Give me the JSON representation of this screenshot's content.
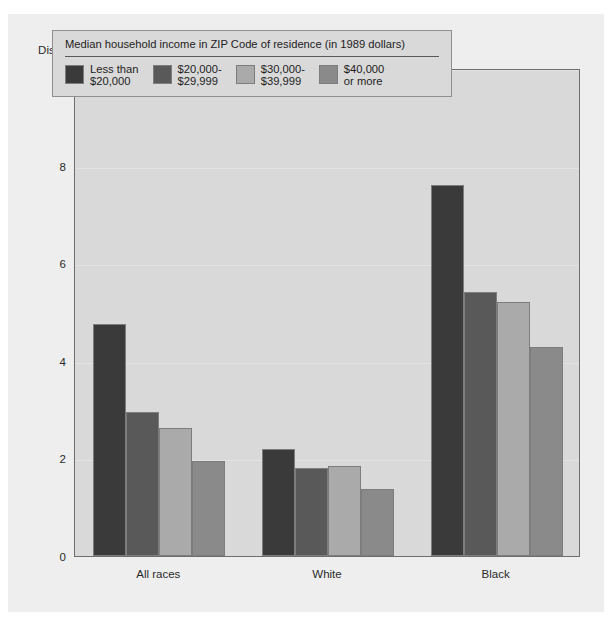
{
  "chart_data": {
    "type": "bar",
    "title": "",
    "ylabel": "Discharges per 1,000 population",
    "xlabel": "",
    "ylim": [
      0,
      10
    ],
    "yticks": [
      0,
      2,
      4,
      6,
      8,
      10
    ],
    "ytick_labels": [
      "0",
      "2",
      "4",
      "6",
      "8",
      "10"
    ],
    "grid": true,
    "legend_position": "inside-top-left",
    "legend_title": "Median household income in ZIP Code of residence (in 1989 dollars)",
    "categories": [
      "All races",
      "White",
      "Black"
    ],
    "series": [
      {
        "name": "Less than $20,000",
        "label_line1": "Less than",
        "label_line2": "$20,000",
        "color": "#3a3a3a",
        "values": [
          4.75,
          2.2,
          7.6
        ]
      },
      {
        "name": "$20,000-$29,999",
        "label_line1": "$20,000-",
        "label_line2": "$29,999",
        "color": "#595959",
        "values": [
          2.95,
          1.8,
          5.4
        ]
      },
      {
        "name": "$30,000-$39,999",
        "label_line1": "$30,000-",
        "label_line2": "$39,999",
        "color": "#aaaaaa",
        "values": [
          2.62,
          1.85,
          5.2
        ]
      },
      {
        "name": "$40,000 or more",
        "label_line1": "$40,000",
        "label_line2": "or more",
        "color": "#8a8a8a",
        "values": [
          1.95,
          1.38,
          4.28
        ]
      }
    ]
  },
  "colors": {
    "page_background": "#ffffff",
    "panel_background": "#eeeeee",
    "plot_background": "#d9d9d9",
    "axis_line": "#6e6e6e",
    "bar_outline": "#7d7d7d",
    "text": "#2a2a2a",
    "gridline": "#e3e3e3"
  }
}
